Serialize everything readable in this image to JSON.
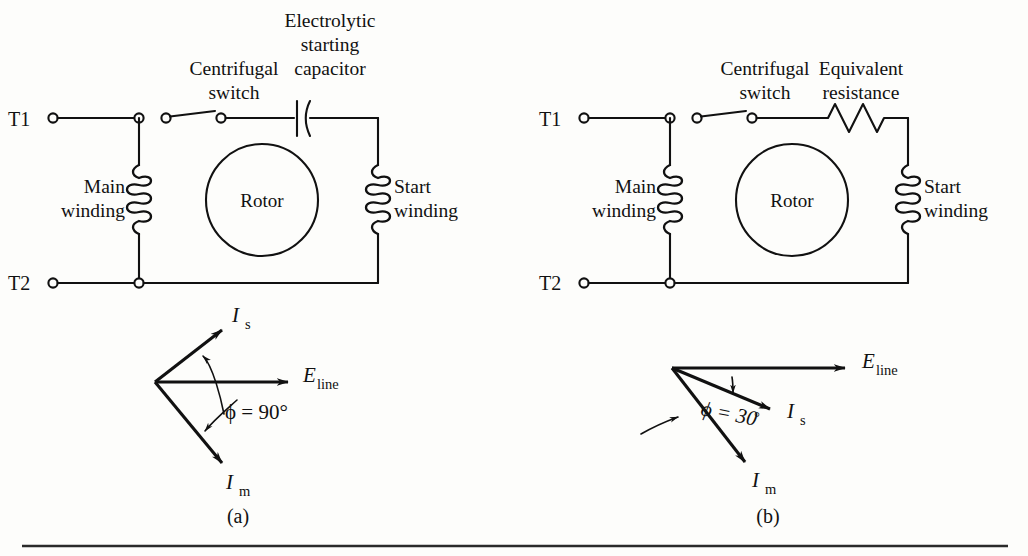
{
  "figure": {
    "background_color": "#fdfdfb",
    "ink_color": "#111111",
    "captions": {
      "a": "(a)",
      "b": "(b)"
    }
  },
  "circuit_a": {
    "terminal_top": "T1",
    "terminal_bottom": "T2",
    "switch_label_line1": "Centrifugal",
    "switch_label_line2": "switch",
    "series_element_line1": "Electrolytic",
    "series_element_line2": "starting",
    "series_element_line3": "capacitor",
    "left_winding_line1": "Main",
    "left_winding_line2": "winding",
    "right_winding_line1": "Start",
    "right_winding_line2": "winding",
    "rotor_label": "Rotor"
  },
  "circuit_b": {
    "terminal_top": "T1",
    "terminal_bottom": "T2",
    "switch_label_line1": "Centrifugal",
    "switch_label_line2": "switch",
    "series_element_line1": "Equivalent",
    "series_element_line2": "resistance",
    "left_winding_line1": "Main",
    "left_winding_line2": "winding",
    "right_winding_line1": "Start",
    "right_winding_line2": "winding",
    "rotor_label": "Rotor"
  },
  "phasor_a": {
    "voltage_symbol": "E",
    "voltage_subscript": "line",
    "start_current_symbol": "I",
    "start_current_subscript": "s",
    "main_current_symbol": "I",
    "main_current_subscript": "m",
    "angle_text": "ϕ = 90°",
    "angle_value": 90,
    "angle_unit": "degrees"
  },
  "phasor_b": {
    "voltage_symbol": "E",
    "voltage_subscript": "line",
    "start_current_symbol": "I",
    "start_current_subscript": "s",
    "main_current_symbol": "I",
    "main_current_subscript": "m",
    "angle_text_symbol": "ϕ = 30",
    "angle_text_unit": "°",
    "angle_value": 30,
    "angle_unit": "degrees"
  }
}
